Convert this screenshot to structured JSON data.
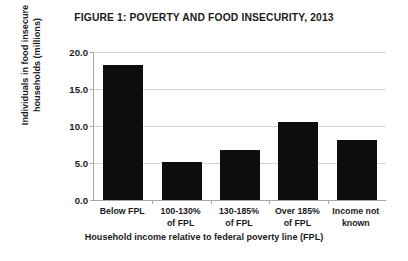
{
  "chart_data": {
    "type": "bar",
    "title": "FIGURE 1: POVERTY AND FOOD INSECURITY, 2013",
    "categories": [
      "Below FPL",
      "100-130% of FPL",
      "130-185% of FPL",
      "Over 185% of FPL",
      "Income not known"
    ],
    "category_lines": [
      {
        "line1": "Below FPL",
        "line2": ""
      },
      {
        "line1": "100-130%",
        "line2": "of FPL"
      },
      {
        "line1": "130-185%",
        "line2": "of FPL"
      },
      {
        "line1": "Over 185%",
        "line2": "of FPL"
      },
      {
        "line1": "Income not",
        "line2": "known"
      }
    ],
    "values": [
      18.3,
      5.2,
      6.8,
      10.5,
      8.1
    ],
    "xlabel": "Household income relative to federal poverty line (FPL)",
    "ylabel": "Individuals in food insecure households (millions)",
    "ylim": [
      0.0,
      20.0
    ],
    "ytick_labels": [
      "0.0",
      "5.0",
      "10.0",
      "15.0",
      "20.0"
    ],
    "ytick_values": [
      0.0,
      5.0,
      10.0,
      15.0,
      20.0
    ],
    "grid": true,
    "legend": false,
    "bar_color": "#0d0d0d",
    "gridline_color": "#d4d4d4",
    "axis_color": "#a6a6a6",
    "background_color": "#ffffff"
  }
}
